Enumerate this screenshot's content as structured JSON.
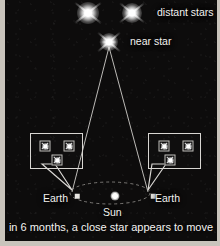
{
  "figure": {
    "caption": "in 6 months, a close star appears to move",
    "background_color": "#0d0c0c",
    "line_color": "#d8d6d2",
    "text_color": "#f2f1ef"
  },
  "labels": {
    "distant_stars": "distant stars",
    "near_star": "near star",
    "earth_left": "Earth",
    "earth_right": "Earth",
    "sun": "Sun"
  },
  "sky_stars": [
    {
      "name": "distant-star-left",
      "x": 88,
      "y": 13,
      "size": 34,
      "label": ""
    },
    {
      "name": "distant-star-right",
      "x": 132,
      "y": 13,
      "size": 32,
      "label": "distant stars"
    },
    {
      "name": "near-star",
      "x": 108,
      "y": 42,
      "size": 30,
      "label": "near star"
    }
  ],
  "sight_lines": [
    {
      "name": "sightline-from-earth-left",
      "from_x": 72,
      "from_y": 195,
      "to_x": 108,
      "to_y": 46
    },
    {
      "name": "sightline-from-earth-right",
      "from_x": 148,
      "from_y": 195,
      "to_x": 108,
      "to_y": 46
    }
  ],
  "orbit": {
    "name": "earth-orbit-ellipse",
    "center_x": 110,
    "center_y": 196,
    "radius_x": 40,
    "radius_y": 11,
    "style": "dashed"
  },
  "sun": {
    "x": 110,
    "y": 196
  },
  "earth_positions": [
    {
      "name": "earth-position-left",
      "x": 72,
      "y": 196
    },
    {
      "name": "earth-position-right",
      "x": 148,
      "y": 196
    }
  ],
  "view_boxes": [
    {
      "name": "view-from-earth-left",
      "x": 25,
      "y": 133,
      "width": 53,
      "height": 36,
      "tail_tip_x": 72,
      "tail_tip_y": 193,
      "tail_base_x1": 42,
      "tail_base_x2": 55,
      "stars": [
        {
          "name": "boxed-distant-star-left",
          "x": 14,
          "y": 12,
          "type": "distant"
        },
        {
          "name": "boxed-distant-star-right",
          "x": 38,
          "y": 12,
          "type": "distant"
        },
        {
          "name": "boxed-near-star",
          "x": 26,
          "y": 26,
          "type": "near"
        }
      ]
    },
    {
      "name": "view-from-earth-right",
      "x": 143,
      "y": 133,
      "width": 53,
      "height": 36,
      "tail_tip_x": 148,
      "tail_tip_y": 193,
      "tail_base_x1": 152,
      "tail_base_x2": 166,
      "stars": [
        {
          "name": "boxed-distant-star-left",
          "x": 15,
          "y": 12,
          "type": "distant"
        },
        {
          "name": "boxed-distant-star-right",
          "x": 39,
          "y": 12,
          "type": "distant"
        },
        {
          "name": "boxed-near-star",
          "x": 21,
          "y": 26,
          "type": "near"
        }
      ]
    }
  ]
}
